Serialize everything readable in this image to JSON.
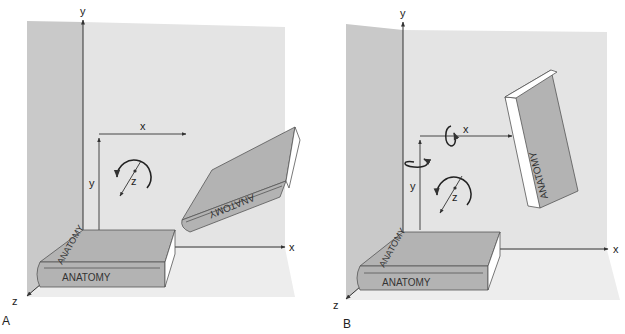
{
  "figure": {
    "panels": [
      {
        "id": "A",
        "panel_label": "A",
        "axis_labels": {
          "y": "y",
          "x": "x",
          "z": "z"
        },
        "local_axis_labels": {
          "x": "x",
          "y": "y",
          "z": "z"
        },
        "book_title": "ANATOMY",
        "rotation_arrows": [
          "z"
        ]
      },
      {
        "id": "B",
        "panel_label": "B",
        "axis_labels": {
          "y": "y",
          "x": "x",
          "z": "z"
        },
        "local_axis_labels": {
          "x": "x",
          "y": "y",
          "z": "z"
        },
        "book_title": "ANATOMY",
        "rotation_arrows": [
          "x",
          "y",
          "z"
        ]
      }
    ],
    "colors": {
      "back_wall": "#e4e4e4",
      "side_wall": "#c9c9c9",
      "floor": "#ececec",
      "book_cover": "#b3b3b3",
      "book_pages": "#ffffff",
      "line": "#333333"
    }
  }
}
